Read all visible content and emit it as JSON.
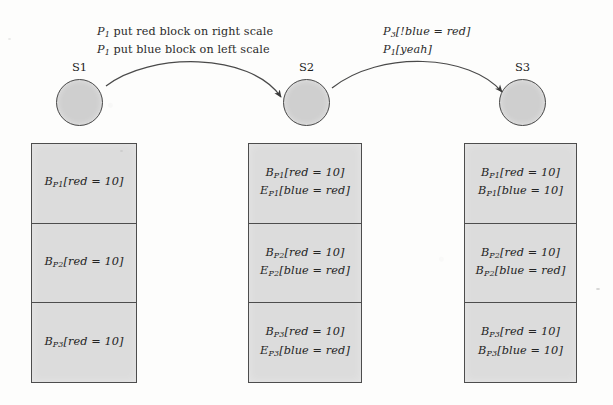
{
  "figure": {
    "type": "space-time-diagram",
    "background_color": "#fdfdfc",
    "box_fill_color": "#dcdcdc",
    "node_fill_color": "#cfcfcf",
    "stroke_color": "#4d4d4d"
  },
  "states": [
    {
      "id": "s1",
      "label": "S1"
    },
    {
      "id": "s2",
      "label": "S2"
    },
    {
      "id": "s3",
      "label": "S3"
    }
  ],
  "transitions": [
    {
      "id": "t1",
      "from": "S1",
      "to": "S2",
      "lines": [
        {
          "actor": "P",
          "actor_sub": "1",
          "text": " put red block on right scale"
        },
        {
          "actor": "P",
          "actor_sub": "1",
          "text": " put blue block on left scale"
        }
      ]
    },
    {
      "id": "t2",
      "from": "S2",
      "to": "S3",
      "lines": [
        {
          "actor": "P",
          "actor_sub": "3",
          "text": "[!blue = red]"
        },
        {
          "actor": "P",
          "actor_sub": "1",
          "text": "[yeah]"
        }
      ]
    }
  ],
  "columns": [
    {
      "id": "column-1",
      "state": "S1",
      "cells": [
        {
          "lines": [
            {
              "sym": "B",
              "sub": "P1",
              "body": "[red = 10]"
            }
          ]
        },
        {
          "lines": [
            {
              "sym": "B",
              "sub": "P2",
              "body": "[red = 10]"
            }
          ]
        },
        {
          "lines": [
            {
              "sym": "B",
              "sub": "P3",
              "body": "[red = 10]"
            }
          ]
        }
      ]
    },
    {
      "id": "column-2",
      "state": "S2",
      "cells": [
        {
          "lines": [
            {
              "sym": "B",
              "sub": "P1",
              "body": "[red = 10]"
            },
            {
              "sym": "E",
              "sub": "P1",
              "body": "[blue = red]"
            }
          ]
        },
        {
          "lines": [
            {
              "sym": "B",
              "sub": "P2",
              "body": "[red = 10]"
            },
            {
              "sym": "E",
              "sub": "P2",
              "body": "[blue = red]"
            }
          ]
        },
        {
          "lines": [
            {
              "sym": "B",
              "sub": "P3",
              "body": "[red = 10]"
            },
            {
              "sym": "E",
              "sub": "P3",
              "body": "[blue = red]"
            }
          ]
        }
      ]
    },
    {
      "id": "column-3",
      "state": "S3",
      "cells": [
        {
          "lines": [
            {
              "sym": "B",
              "sub": "P1",
              "body": "[red = 10]"
            },
            {
              "sym": "B",
              "sub": "P1",
              "body": "[blue = 10]"
            }
          ]
        },
        {
          "lines": [
            {
              "sym": "B",
              "sub": "P2",
              "body": "[red = 10]"
            },
            {
              "sym": "B",
              "sub": "P2",
              "body": "[blue = red]"
            }
          ]
        },
        {
          "lines": [
            {
              "sym": "B",
              "sub": "P3",
              "body": "[red = 10]"
            },
            {
              "sym": "B",
              "sub": "P3",
              "body": "[blue = 10]"
            }
          ]
        }
      ]
    }
  ]
}
